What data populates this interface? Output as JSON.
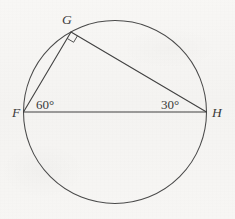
{
  "figure": {
    "kind": "circle-inscribed-triangle-diagram",
    "background_color": "#f6f5f3",
    "stroke_color": "#4a4a4a",
    "text_color": "#3a3a3a",
    "circle": {
      "center_x": 115,
      "center_y": 112,
      "radius": 91.5
    },
    "vertices": {
      "F": {
        "label": "F",
        "x": 23.5,
        "y": 112,
        "label_x": 12,
        "label_y": 117
      },
      "G": {
        "label": "G",
        "x": 71,
        "y": 32,
        "label_x": 62,
        "label_y": 24
      },
      "H": {
        "label": "H",
        "x": 206.5,
        "y": 112,
        "label_x": 212,
        "label_y": 117
      }
    },
    "segments": [
      {
        "name": "segment-FH",
        "from": "F",
        "to": "H"
      },
      {
        "name": "segment-FG",
        "from": "F",
        "to": "G"
      },
      {
        "name": "segment-GH",
        "from": "G",
        "to": "H"
      }
    ],
    "angles": [
      {
        "name": "angle-at-F",
        "vertex": "F",
        "text": "60°",
        "label_x": 36,
        "label_y": 109
      },
      {
        "name": "angle-at-H",
        "vertex": "H",
        "text": "30°",
        "label_x": 161,
        "label_y": 109
      },
      {
        "name": "angle-at-G",
        "vertex": "G",
        "text": "",
        "marker": "right-angle-square"
      }
    ]
  }
}
